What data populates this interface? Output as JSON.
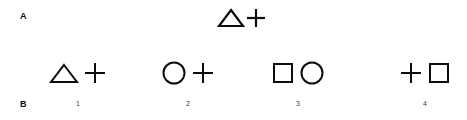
{
  "figure": {
    "background_color": "#ffffff",
    "stroke_color": "#0d0d0d",
    "panels": [
      {
        "id": "A",
        "label": "A",
        "role": "sample",
        "items": [
          {
            "id": "sample",
            "shapes": [
              "triangle",
              "plus"
            ]
          }
        ]
      },
      {
        "id": "B",
        "label": "B",
        "role": "options",
        "items": [
          {
            "id": "option-1",
            "number": "1",
            "shapes": [
              "triangle",
              "plus"
            ]
          },
          {
            "id": "option-2",
            "number": "2",
            "shapes": [
              "circle",
              "plus"
            ]
          },
          {
            "id": "option-3",
            "number": "3",
            "shapes": [
              "square",
              "circle"
            ]
          },
          {
            "id": "option-4",
            "number": "4",
            "shapes": [
              "plus",
              "square"
            ]
          }
        ]
      }
    ]
  }
}
